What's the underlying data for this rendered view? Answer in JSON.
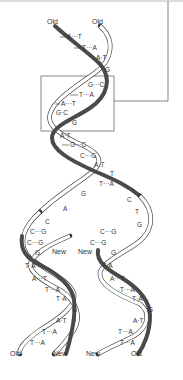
{
  "figure": {
    "top_labels": [
      "Old",
      "Old"
    ],
    "bottom_labels_left": [
      "Old",
      "New"
    ],
    "bottom_labels_right": [
      "New",
      "Old"
    ],
    "middle_labels": [
      "New",
      "New"
    ]
  },
  "parent_helix": {
    "base_pairs": [
      "A···T",
      "T···A",
      "A·T",
      "G",
      "G···C",
      "T···A",
      "A···T",
      "G·C",
      "G",
      "A·T",
      "G···C",
      "C···G",
      "A·T",
      "T",
      "T···A"
    ]
  },
  "fork": {
    "left_unpaired": [
      "G",
      "A",
      "C"
    ],
    "right_unpaired": [
      "C",
      "T",
      "G"
    ]
  },
  "left_daughter": {
    "base_pairs": [
      "C···G",
      "C···G",
      "G",
      "T·A",
      "A···T",
      "T···A",
      "T·A",
      "G",
      "A·T",
      "T···A",
      "T···A"
    ]
  },
  "right_daughter": {
    "base_pairs": [
      "C···G",
      "C···G",
      "G",
      "T·A",
      "A···T",
      "T···A",
      "T·A",
      "G",
      "A·T",
      "T···A",
      "T···A"
    ]
  },
  "highlight_box": {
    "present": true,
    "connector_to": "top-right frame"
  }
}
